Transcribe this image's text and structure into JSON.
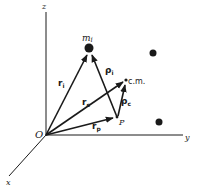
{
  "diagram": {
    "axes": {
      "x_label": "x",
      "y_label": "y",
      "z_label": "z",
      "origin_label": "O"
    },
    "points": {
      "particle_label": "m",
      "particle_subscript": "i",
      "cm_label": "c.m.",
      "p_label": "P"
    },
    "vectors": {
      "r_i": {
        "base": "r",
        "sub": "i"
      },
      "r_c": {
        "base": "r",
        "sub": "c"
      },
      "r_p": {
        "base": "r",
        "sub": "p"
      },
      "rho_i": {
        "base": "ρ",
        "sub": "i"
      },
      "rho_c": {
        "base": "ρ",
        "sub": "c"
      }
    },
    "colors": {
      "ink": "#1a1a1a",
      "background": "#ffffff"
    }
  }
}
